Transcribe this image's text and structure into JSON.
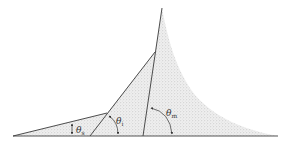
{
  "diagram": {
    "type": "contact-angle-schematic",
    "colors": {
      "line": "#3a3a3a",
      "fill": "#d9d9d9",
      "fill_dots": "#9a9a9a",
      "background": "#ffffff"
    },
    "labels": {
      "theta_s": {
        "symbol": "θ",
        "subscript": "s"
      },
      "theta_i": {
        "symbol": "θ",
        "subscript": "i"
      },
      "theta_m": {
        "symbol": "θ",
        "subscript": "m"
      }
    }
  }
}
